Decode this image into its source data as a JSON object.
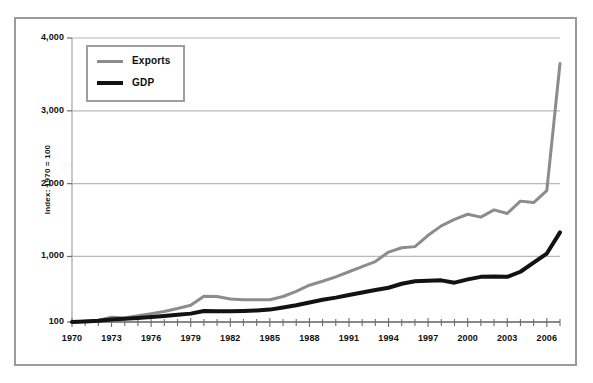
{
  "chart_data": {
    "type": "line",
    "title": "",
    "subtitle": "",
    "xlabel": "",
    "ylabel": "Index: 1970 = 100",
    "ylim": [
      100,
      4000
    ],
    "xlim": [
      1970,
      2007
    ],
    "grid": true,
    "legend_position": "top-left",
    "y_ticks": [
      100,
      1000,
      2000,
      3000,
      4000
    ],
    "y_tick_labels": [
      "100",
      "1,000",
      "2,000",
      "3,000",
      "4,000"
    ],
    "x_ticks": [
      1970,
      1973,
      1976,
      1979,
      1982,
      1985,
      1988,
      1991,
      1994,
      1997,
      2000,
      2003,
      2006
    ],
    "x_tick_labels": [
      "1970",
      "1973",
      "1976",
      "1979",
      "1982",
      "1985",
      "1988",
      "1991",
      "1994",
      "1997",
      "2000",
      "2003",
      "2006"
    ],
    "x_minor_ticks_every": 1,
    "x": [
      1970,
      1971,
      1972,
      1973,
      1974,
      1975,
      1976,
      1977,
      1978,
      1979,
      1980,
      1981,
      1982,
      1983,
      1984,
      1985,
      1986,
      1987,
      1988,
      1989,
      1990,
      1991,
      1992,
      1993,
      1994,
      1995,
      1996,
      1997,
      1998,
      1999,
      2000,
      2001,
      2002,
      2003,
      2004,
      2005,
      2006,
      2007
    ],
    "series": [
      {
        "name": "Exports",
        "color": "#8c8c90",
        "width": 3,
        "values": [
          100,
          110,
          125,
          165,
          155,
          185,
          215,
          245,
          285,
          330,
          455,
          450,
          415,
          405,
          405,
          405,
          450,
          520,
          605,
          660,
          720,
          790,
          860,
          930,
          1060,
          1120,
          1135,
          1290,
          1420,
          1510,
          1580,
          1540,
          1640,
          1590,
          1760,
          1740,
          1905,
          3650
        ]
      },
      {
        "name": "GDP",
        "color": "#121212",
        "width": 4,
        "values": [
          100,
          108,
          118,
          135,
          145,
          155,
          168,
          182,
          198,
          215,
          250,
          248,
          248,
          252,
          258,
          270,
          300,
          330,
          368,
          405,
          435,
          470,
          505,
          540,
          570,
          625,
          660,
          665,
          672,
          640,
          685,
          720,
          725,
          720,
          790,
          915,
          1040,
          1330
        ]
      }
    ],
    "annotations": []
  },
  "legend": {
    "items": [
      {
        "label": "Exports",
        "swatch": "exports"
      },
      {
        "label": "GDP",
        "swatch": "gdp"
      }
    ]
  },
  "ghost_text": {
    "lines": [
      "Key Concepts in Internat",
      "and Business",
      "chapter 12",
      "the world economy",
      "trade liberalisation has",
      "driven global growth in",
      "exports faster than the",
      "growth of output since"
    ]
  }
}
